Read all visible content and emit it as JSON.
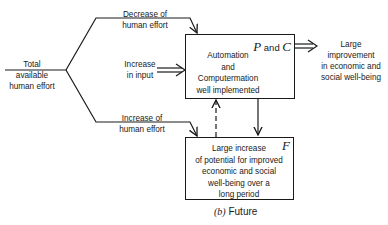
{
  "diagram": {
    "source_label": "Total available\nhuman effort",
    "upper_branch_label": "Decrease of\nhuman effort",
    "middle_input_label": "Increase\nin input",
    "lower_branch_label": "Increase of\nhuman effort",
    "box_pc": {
      "text": "Automation\nand\nComputermation\nwell implemented",
      "tag_p": "P",
      "tag_and": " and ",
      "tag_c": "C"
    },
    "box_f": {
      "text": "Large increase\nof potential for improved\neconomic and social\nwell-being over a\nlong period",
      "tag": "F"
    },
    "output_label": "Large improvement\nin economic and\nsocial well-being",
    "caption_letter": "(b)",
    "caption_text": " Future"
  }
}
